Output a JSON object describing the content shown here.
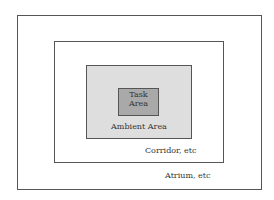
{
  "diagram": {
    "zones": [
      {
        "id": "atrium",
        "label": "Atrium, etc",
        "fill": "#ffffff"
      },
      {
        "id": "corridor",
        "label": "Corridor, etc",
        "fill": "#ffffff"
      },
      {
        "id": "ambient",
        "label": "Ambient Area",
        "fill": "#dedede"
      },
      {
        "id": "task",
        "label_line1": "Task",
        "label_line2": "Area",
        "fill": "#a9a9a9"
      }
    ],
    "border_color": "#555555"
  }
}
